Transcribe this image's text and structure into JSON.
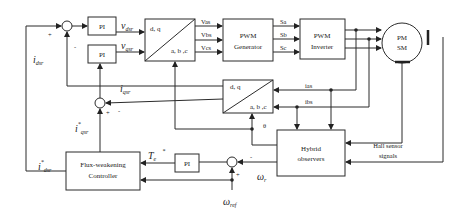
{
  "diagram": {
    "type": "control-block-diagram",
    "blocks": {
      "pi_d": "PI",
      "pi_q": "PI",
      "pi_speed": "PI",
      "dq_abc_top": {
        "top": "d, q",
        "bottom": "a, b ,c"
      },
      "pwm_generator": {
        "line1": "PWM",
        "line2": "Generator"
      },
      "pwm_inverter": {
        "line1": "PWM",
        "line2": "Inverter"
      },
      "motor": {
        "line1": "PM",
        "line2": "SM"
      },
      "abc_dq_mid": {
        "top": "d, q",
        "bottom": "a, b ,c"
      },
      "hybrid_observers": {
        "line1": "Hybrid",
        "line2": "observers"
      },
      "flux_weakening": {
        "line1": "Flux-weakening",
        "line2": "Controller"
      }
    },
    "signals": {
      "vdsr": {
        "main": "v",
        "sub": "dsr"
      },
      "vqsr": {
        "main": "v",
        "sub": "qsr"
      },
      "vas": "Vas",
      "vbs": "Vbs",
      "vcs": "Vcs",
      "sa": "Sa",
      "sb": "Sb",
      "sc": "Sc",
      "ias": "ias",
      "ibs": "ibs",
      "theta": "θ",
      "idsr": {
        "main": "i",
        "sub": "dsr"
      },
      "iqsr": {
        "main": "i",
        "sub": "qsr"
      },
      "iqsr_ref": {
        "main": "i",
        "sub": "qsr",
        "sup": "*"
      },
      "idsr_ref": {
        "main": "i",
        "sub": "dsr",
        "sup": "*"
      },
      "te_ref": {
        "main": "T",
        "sub": "e",
        "sup": "*"
      },
      "omega_r": {
        "main": "ω",
        "sub": "r"
      },
      "omega_ref": {
        "main": "ω",
        "sub": "ref"
      },
      "hall": {
        "line1": "Hall sensor",
        "line2": "signals"
      }
    },
    "signs": {
      "plus": "+",
      "minus": "-"
    }
  }
}
